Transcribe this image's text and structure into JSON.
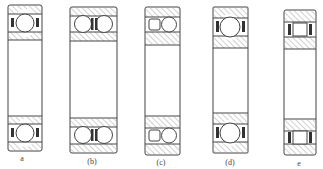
{
  "figure": {
    "colors": {
      "ink": "#444444",
      "hatch": "#8a8a8a",
      "paper": "#ffffff"
    },
    "bearings": [
      {
        "id": "a",
        "label": "a",
        "type": "single-row deep groove ball bearing",
        "x": 8,
        "w": 34,
        "y": 5,
        "h": 146,
        "label_x": 22,
        "label_y": 154
      },
      {
        "id": "b",
        "label": "(b)",
        "type": "double-row ball bearing",
        "x": 70,
        "w": 47,
        "y": 7,
        "h": 146,
        "label_x": 92,
        "label_y": 157
      },
      {
        "id": "c",
        "label": "(c)",
        "type": "combined roller and ball bearing",
        "x": 145,
        "w": 35,
        "y": 7,
        "h": 148,
        "label_x": 161,
        "label_y": 158
      },
      {
        "id": "d",
        "label": "(d)",
        "type": "angular contact ball bearing",
        "x": 213,
        "w": 35,
        "y": 7,
        "h": 146,
        "label_x": 230,
        "label_y": 158
      },
      {
        "id": "e",
        "label": "e",
        "type": "cylindrical roller bearing",
        "x": 284,
        "w": 32,
        "y": 10,
        "h": 145,
        "label_x": 299,
        "label_y": 159
      }
    ]
  }
}
